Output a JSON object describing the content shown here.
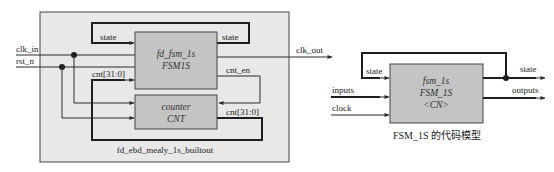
{
  "left_diagram": {
    "container_label": "fd_ebd_mealy_1s_builtout",
    "fsm_block": {
      "instance": "fd_fsm_1s",
      "module": "FSM1S"
    },
    "counter_block": {
      "instance": "counter",
      "module": "CNT"
    },
    "inputs": {
      "clk": "clk_in",
      "rst": "rst_n"
    },
    "output": "clk_out",
    "signals": {
      "state_in": "state",
      "state_out": "state",
      "cnt_in": "cnt[31:0]",
      "cnt_en": "cnt_en",
      "cnt_out": "cnt[31:0]"
    }
  },
  "right_diagram": {
    "block": {
      "instance": "fsm_1s",
      "module": "FSM_1S",
      "tag": "<CN>"
    },
    "inputs": {
      "state": "state",
      "inputs": "inputs",
      "clock": "clock"
    },
    "outputs": {
      "state": "state",
      "outputs": "outputs"
    },
    "caption": "FSM_1S 的代码模型"
  },
  "colors": {
    "container_fill": "#e8e8e8",
    "block_fill": "#c4c4c4",
    "line": "#2a2a2a"
  }
}
